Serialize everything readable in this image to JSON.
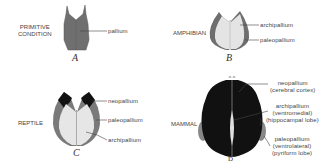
{
  "figure": {
    "panels": [
      {
        "id": "A",
        "caption": "A",
        "group": [
          "PRIMITIVE",
          "CONDITION"
        ],
        "labels": [
          "pallium"
        ]
      },
      {
        "id": "B",
        "caption": "B",
        "group": [
          "AMPHIBIAN"
        ],
        "labels": [
          "archipallium",
          "paleopallium"
        ]
      },
      {
        "id": "C",
        "caption": "C",
        "group": [
          "REPTILE"
        ],
        "labels": [
          "neopallium",
          "paleopallium",
          "archipallium"
        ]
      },
      {
        "id": "D",
        "caption": "D",
        "group": [
          "MAMMAL"
        ],
        "labels": [
          [
            "neopallium",
            "(cerebral cortex)"
          ],
          [
            "archipallium",
            "(ventromedial)",
            "(hippocampal lobe)"
          ],
          [
            "paleopallium",
            "(ventrolateral)",
            "(pyriform lobe)"
          ]
        ]
      }
    ]
  },
  "colors": {
    "pallium": "#6f6f6f",
    "archipallium": "#e2e2e2",
    "paleopallium": "#7a7a7a",
    "neopallium": "#111111",
    "line": "#444444"
  }
}
